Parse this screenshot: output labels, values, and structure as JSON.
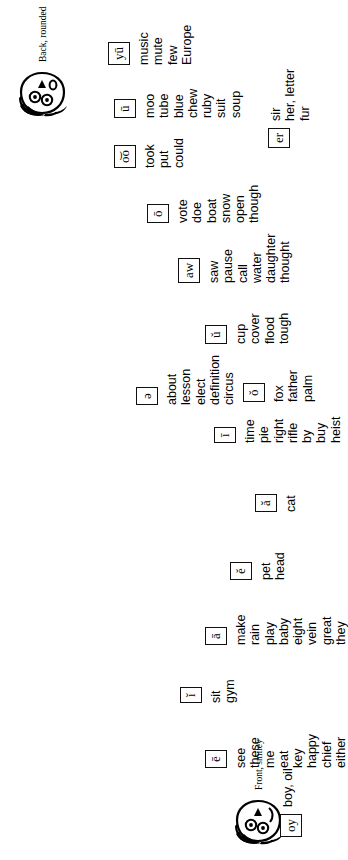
{
  "chart": {
    "faces": [
      {
        "id": "front-smiley",
        "caption": "Front, smiley"
      },
      {
        "id": "back-rounded",
        "caption": "Back, rounded"
      }
    ],
    "columns": [
      {
        "id": "long-e",
        "symbol": "ē",
        "words": [
          "see",
          "these",
          "me",
          "eat",
          "key",
          "happy",
          "chief",
          "either"
        ]
      },
      {
        "id": "short-i",
        "symbol": "ĭ",
        "words": [
          "sit",
          "gym"
        ]
      },
      {
        "id": "long-a",
        "symbol": "ā",
        "words": [
          "make",
          "rain",
          "play",
          "baby",
          "eight",
          "vein",
          "great",
          "they"
        ]
      },
      {
        "id": "short-e",
        "symbol": "ĕ",
        "words": [
          "pet",
          "head"
        ]
      },
      {
        "id": "short-a",
        "symbol": "ă",
        "words": [
          "cat"
        ]
      },
      {
        "id": "long-i",
        "symbol": "ī",
        "words": [
          "time",
          "pie",
          "right",
          "rifle",
          "by",
          "buy",
          "heist"
        ]
      },
      {
        "id": "schwa",
        "symbol": "ə",
        "words": [
          "about",
          "lesson",
          "elect",
          "definition",
          "circus"
        ]
      },
      {
        "id": "short-o",
        "symbol": "ŏ",
        "words": [
          "fox",
          "father",
          "palm"
        ]
      },
      {
        "id": "short-u",
        "symbol": "ŭ",
        "words": [
          "cup",
          "cover",
          "flood",
          "tough"
        ]
      },
      {
        "id": "aw",
        "symbol": "aw",
        "words": [
          "saw",
          "pause",
          "call",
          "water",
          "daughter",
          "thought"
        ]
      },
      {
        "id": "long-o",
        "symbol": "ō",
        "words": [
          "vote",
          "doe",
          "boat",
          "snow",
          "open",
          "though"
        ]
      },
      {
        "id": "oo",
        "symbol": "o͝o",
        "words": [
          "took",
          "put",
          "could"
        ]
      },
      {
        "id": "long-u",
        "symbol": "ū",
        "words": [
          "moo",
          "tube",
          "blue",
          "chew",
          "ruby",
          "suit",
          "soup"
        ]
      },
      {
        "id": "yu",
        "symbol": "yū",
        "words": [
          "music",
          "mute",
          "few",
          "Europe"
        ]
      }
    ],
    "side_blocks": [
      {
        "id": "er",
        "symbol": "er",
        "words": [
          "sir",
          "her, letter",
          "fur"
        ]
      },
      {
        "id": "oy",
        "symbol": "oy",
        "words": [
          "boy, oil"
        ]
      }
    ],
    "colors": {
      "ink": "#000000",
      "paper": "#ffffff"
    }
  }
}
